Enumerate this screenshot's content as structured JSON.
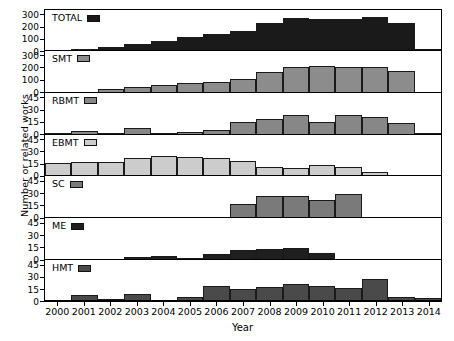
{
  "chart_data": {
    "type": "bar",
    "title": "",
    "xlabel": "Year",
    "ylabel": "Number or related works",
    "grid": false,
    "legend_position": "inside-top-left-of-each-panel",
    "categories": [
      "2000",
      "2001",
      "2002",
      "2003",
      "2004",
      "2005",
      "2006",
      "2007",
      "2008",
      "2009",
      "2010",
      "2011",
      "2012",
      "2013",
      "2014"
    ],
    "panels": [
      {
        "name": "TOTAL",
        "label": "TOTAL",
        "color": "#1a1a1a",
        "ylim": [
          0,
          330
        ],
        "yticks": [
          0,
          100,
          200,
          300
        ],
        "values": [
          8,
          18,
          28,
          52,
          78,
          108,
          135,
          160,
          222,
          268,
          258,
          255,
          275,
          228,
          12
        ]
      },
      {
        "name": "SMT",
        "label": "SMT",
        "color": "#8c8c8c",
        "ylim": [
          0,
          330
        ],
        "yticks": [
          0,
          100,
          200,
          300
        ],
        "values": [
          2,
          5,
          28,
          48,
          62,
          75,
          90,
          110,
          165,
          205,
          212,
          205,
          208,
          178,
          8
        ]
      },
      {
        "name": "RBMT",
        "label": "RBMT",
        "color": "#878787",
        "ylim": [
          0,
          50
        ],
        "yticks": [
          0,
          15,
          30,
          45
        ],
        "values": [
          0,
          4,
          0,
          8,
          2,
          3,
          5,
          15,
          19,
          24,
          15,
          24,
          22,
          14,
          2
        ]
      },
      {
        "name": "EBMT",
        "label": "EBMT",
        "color": "#cccccc",
        "ylim": [
          0,
          50
        ],
        "yticks": [
          0,
          15,
          30,
          45
        ],
        "values": [
          16,
          17,
          18,
          23,
          25,
          24,
          23,
          19,
          11,
          10,
          14,
          12,
          5,
          0,
          2
        ]
      },
      {
        "name": "SC",
        "label": "SC",
        "color": "#7a7a7a",
        "ylim": [
          0,
          50
        ],
        "yticks": [
          0,
          15,
          30,
          45
        ],
        "values": [
          0,
          0,
          0,
          0,
          0,
          0,
          1,
          17,
          27,
          27,
          22,
          30,
          2,
          2,
          1
        ]
      },
      {
        "name": "ME",
        "label": "ME",
        "color": "#1f1f1f",
        "ylim": [
          0,
          50
        ],
        "yticks": [
          0,
          15,
          30,
          45
        ],
        "values": [
          1,
          1,
          1,
          4,
          5,
          3,
          7,
          12,
          13,
          15,
          9,
          1,
          0,
          1,
          1
        ]
      },
      {
        "name": "HMT",
        "label": "HMT",
        "color": "#4a4a4a",
        "ylim": [
          0,
          50
        ],
        "yticks": [
          0,
          15,
          30,
          45
        ],
        "values": [
          1,
          7,
          2,
          8,
          1,
          5,
          18,
          14,
          17,
          21,
          18,
          16,
          27,
          5,
          4
        ]
      }
    ]
  }
}
